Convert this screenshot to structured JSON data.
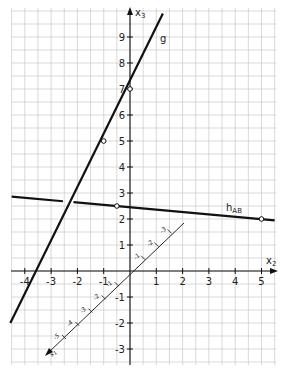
{
  "diagram": {
    "type": "coordinate-plane",
    "axes": {
      "x2": {
        "label": "x2",
        "ticks": [
          -4,
          -3,
          -2,
          -1,
          1,
          2,
          3,
          4,
          5
        ]
      },
      "x3": {
        "label": "x3",
        "ticks": [
          -3,
          -2,
          -1,
          1,
          2,
          3,
          4,
          5,
          6,
          7,
          8,
          9
        ]
      },
      "x1": {
        "label": "x1",
        "ticks_negative_side": [
          -1,
          -2,
          -3,
          -4,
          -5
        ],
        "ticks_positive_side": [
          1,
          2,
          3
        ]
      }
    },
    "lines": [
      {
        "name": "g",
        "label": "g",
        "points_marked": [
          {
            "x2": 0,
            "x3": 7
          },
          {
            "x2": -1,
            "x3": 5
          }
        ],
        "extent": {
          "from": {
            "x2": -4.55,
            "x3": -2
          },
          "to": {
            "x2": 1.25,
            "x3": 9.9
          }
        }
      },
      {
        "name": "h_AB",
        "label": "h",
        "subscript": "AB",
        "points_marked": [
          {
            "x2": -0.5,
            "x3": 2.5
          },
          {
            "x2": 5,
            "x3": 2
          }
        ],
        "extent": {
          "from": {
            "x2": -4.5,
            "x3": 2.86
          },
          "to": {
            "x2": 5.5,
            "x3": 1.95
          }
        },
        "gap_near_x2": -2.3
      }
    ],
    "colors": {
      "grid": "#c8c8c8",
      "axis": "#111111",
      "line": "#111111",
      "background": "#ffffff"
    }
  }
}
